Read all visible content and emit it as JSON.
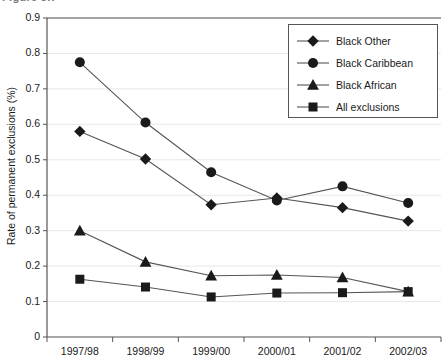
{
  "title_fragment": "Figure 3.7",
  "axes": {
    "ylabel": "Rate of permanent exclusions (%)",
    "xlabel": "",
    "yticks": [
      "0",
      "0.1",
      "0.2",
      "0.3",
      "0.4",
      "0.5",
      "0.6",
      "0.7",
      "0.8",
      "0.9"
    ],
    "xticks": [
      "1997/98",
      "1998/99",
      "1999/00",
      "2000/01",
      "2001/02",
      "2002/03"
    ]
  },
  "legend": {
    "position": "top-right",
    "entries": [
      {
        "label": "Black Other",
        "marker": "diamond-marker"
      },
      {
        "label": "Black Caribbean",
        "marker": "circle-marker"
      },
      {
        "label": "Black African",
        "marker": "triangle-marker"
      },
      {
        "label": "All exclusions",
        "marker": "square-marker"
      }
    ]
  },
  "colors": {
    "marker": "#1a1a1a",
    "line": "#555555",
    "grid": "#e8e8e8",
    "axis": "#555555",
    "background": "#ffffff"
  },
  "chart_data": {
    "type": "line",
    "title": "",
    "xlabel": "",
    "ylabel": "Rate of permanent exclusions (%)",
    "categories": [
      "1997/98",
      "1998/99",
      "1999/00",
      "2000/01",
      "2001/02",
      "2002/03"
    ],
    "ylim": [
      0,
      0.9
    ],
    "ytick_values": [
      0,
      0.1,
      0.2,
      0.3,
      0.4,
      0.5,
      0.6,
      0.7,
      0.8,
      0.9
    ],
    "grid": true,
    "legend_position": "upper right",
    "series": [
      {
        "name": "Black Other",
        "marker": "diamond",
        "values": [
          0.58,
          0.502,
          0.373,
          0.392,
          0.365,
          0.327
        ]
      },
      {
        "name": "Black Caribbean",
        "marker": "circle",
        "values": [
          0.775,
          0.605,
          0.465,
          0.385,
          0.425,
          0.378
        ]
      },
      {
        "name": "Black African",
        "marker": "triangle",
        "values": [
          0.3,
          0.212,
          0.173,
          0.175,
          0.168,
          0.128
        ]
      },
      {
        "name": "All exclusions",
        "marker": "square",
        "values": [
          0.163,
          0.141,
          0.113,
          0.124,
          0.125,
          0.128
        ]
      }
    ]
  }
}
